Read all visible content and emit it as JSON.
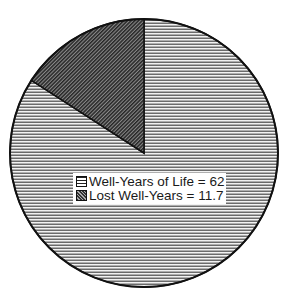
{
  "chart_data": {
    "type": "pie",
    "title": "",
    "categories": [
      "Well-Years of Life",
      "Lost Well-Years"
    ],
    "values": [
      62,
      11.7
    ],
    "percentages": [
      84.1,
      15.9
    ],
    "start_angle_deg": 90,
    "direction": "counterclockwise for Lost slice from 12 o'clock",
    "legend_position": "inside lower-center of pie",
    "legend": [
      {
        "label": "Well-Years of Life = 62",
        "pattern": "horizontal-lines",
        "color": "#d9d9d9"
      },
      {
        "label": "Lost Well-Years = 11.7",
        "pattern": "diagonal-hatch",
        "color": "#555555"
      }
    ]
  },
  "legend": {
    "items": [
      {
        "label": "Well-Years of Life = 62"
      },
      {
        "label": "Lost Well-Years = 11.7"
      }
    ]
  },
  "colors": {
    "outline": "#111111",
    "well_fill": "#d6d6d6",
    "lost_fill": "#4d4d4d",
    "background": "#ffffff"
  }
}
